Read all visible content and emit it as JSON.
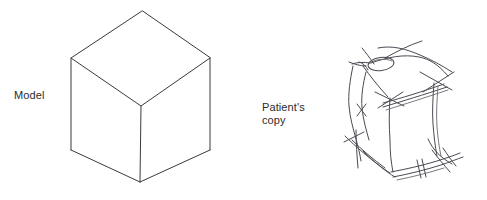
{
  "figure": {
    "caption_left": "Model",
    "caption_right": "Patient's\ncopy",
    "background_color": "#ffffff",
    "model_line_color": "#3a3a3a",
    "sketch_line_color": "#4a4a52",
    "label_text_color": "#2b2b2b"
  },
  "labels": {
    "model": "Model",
    "patient_line1": "Patient's",
    "patient_line2": "copy"
  },
  "model_cube": {
    "name": "isometric-cube",
    "description": "Clean line drawing of a cube in isometric projection",
    "vertices": {
      "top_apex": [
        142,
        11
      ],
      "left_top": [
        71,
        58
      ],
      "right_top": [
        210,
        58
      ],
      "center_front": [
        141,
        106
      ],
      "left_bottom": [
        71,
        150
      ],
      "right_bottom": [
        210,
        150
      ],
      "bottom_front": [
        140,
        182
      ]
    },
    "edges": [
      [
        "top_apex",
        "left_top"
      ],
      [
        "top_apex",
        "right_top"
      ],
      [
        "left_top",
        "center_front"
      ],
      [
        "right_top",
        "center_front"
      ],
      [
        "left_top",
        "left_bottom"
      ],
      [
        "right_top",
        "right_bottom"
      ],
      [
        "center_front",
        "bottom_front"
      ],
      [
        "left_bottom",
        "bottom_front"
      ],
      [
        "right_bottom",
        "bottom_front"
      ]
    ]
  },
  "patient_cube": {
    "name": "distorted-cube-sketch",
    "description": "Hand drawn copy of the cube showing overshooting lines, crossed vertices, doubled parallel strokes and a small oval loop on the top face",
    "features": [
      "overshooting-lines",
      "closing-in-errors",
      "doubled-strokes",
      "oval-loop-on-top-face",
      "wavy-tremulous-edges"
    ]
  }
}
